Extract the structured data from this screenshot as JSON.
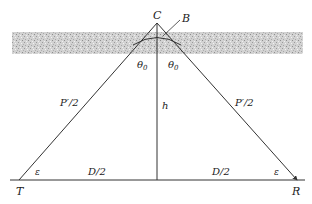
{
  "diagram": {
    "type": "ionospheric-reflection-geometry",
    "layer": {
      "label": "ionosphere",
      "fill": "#c9c9c9"
    },
    "points": {
      "apex": "C",
      "reflection_point": "B",
      "transmitter": "T",
      "receiver": "R"
    },
    "labels": {
      "left_path": "P′/2",
      "right_path": "P′/2",
      "height": "h",
      "left_base": "D/2",
      "right_base": "D/2",
      "left_incidence": "θ",
      "right_incidence": "θ",
      "incidence_sub": "0",
      "left_elevation": "ε",
      "right_elevation": "ε"
    },
    "colors": {
      "line": "#333333",
      "text": "#222222"
    }
  }
}
